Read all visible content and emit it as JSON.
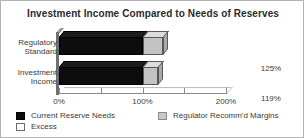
{
  "chart_data": {
    "type": "bar",
    "orientation": "horizontal",
    "title": "Investment Income Compared to Needs of Reserves",
    "xlabel": "",
    "ylabel": "",
    "categories": [
      "Regulatory Standard",
      "Investment Income"
    ],
    "value_labels": [
      "125%",
      "119%"
    ],
    "values": [
      125,
      119
    ],
    "series": [
      {
        "name": "Current Reserve Needs",
        "values": [
          100,
          100
        ],
        "color": "#0d0d0d"
      },
      {
        "name": "Regulator Recomm'd Margins",
        "values": [
          25,
          19
        ],
        "color": "#c3c3c3"
      }
    ],
    "xlim": [
      0,
      200
    ],
    "xticks": [
      0,
      50,
      100,
      150,
      200
    ],
    "xtick_labels": [
      "0%",
      "",
      "100%",
      "",
      "200%"
    ],
    "grid": false,
    "legend_position": "bottom",
    "style": "3d"
  },
  "title": {
    "text": "Investment Income Compared to Needs of Reserves"
  },
  "categories": [
    {
      "line1": "Regulatory",
      "line2": "Standard",
      "value": "125%"
    },
    {
      "line1": "Investment",
      "line2": "Income",
      "value": "119%"
    }
  ],
  "axis": {
    "ticks": [
      {
        "value": 0,
        "label": "0%"
      },
      {
        "value": 50,
        "label": ""
      },
      {
        "value": 100,
        "label": "100%"
      },
      {
        "value": 150,
        "label": ""
      },
      {
        "value": 200,
        "label": "200%"
      }
    ]
  },
  "legend": {
    "current_reserve_needs": "Current Reserve Needs",
    "excess": "Excess",
    "regulator_margins": "Regulator Recomm'd Margins"
  },
  "colors": {
    "reserve_needs": "#0d0d0d",
    "margins": "#c3c3c3",
    "excess": "#ffffff",
    "frame": "#b3b3b3",
    "text": "#3a3a3a"
  }
}
